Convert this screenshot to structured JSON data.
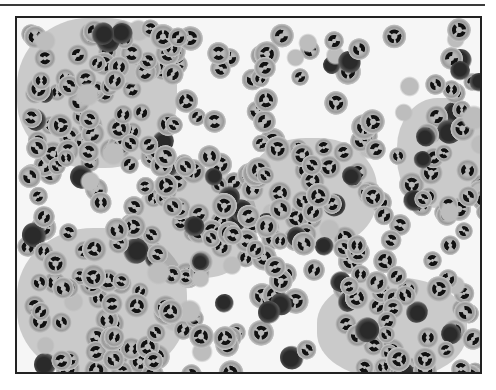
{
  "image": {
    "subject": "micrograph of clustered neutrophils with lobulated dark nuclei",
    "colors": {
      "background": "#f6f6f6",
      "frame": "#222222",
      "rule": "#3a3a3a"
    }
  }
}
